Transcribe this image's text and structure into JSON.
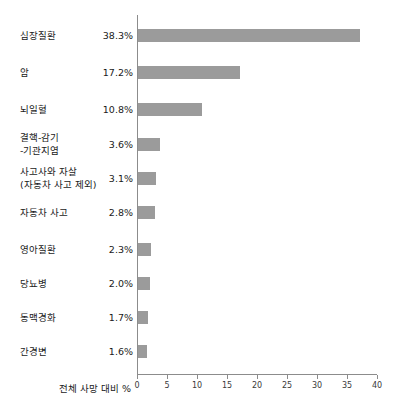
{
  "chart_data": {
    "type": "bar",
    "orientation": "horizontal",
    "title": "",
    "subtitle": "",
    "xlabel": "전체 사망 대비 %",
    "ylabel": "",
    "xlim": [
      0,
      40
    ],
    "xticks": [
      0,
      5,
      10,
      15,
      20,
      25,
      30,
      35,
      40
    ],
    "xtick_labels": [
      "0",
      "5",
      "10",
      "15",
      "20",
      "25",
      "30",
      "35",
      "40"
    ],
    "grid": false,
    "legend": null,
    "bar_color": "#9b9b9b",
    "axis_color": "#8c8c8c",
    "categories": [
      "심장질환",
      "암",
      "뇌일혈",
      "결핵-감기\n-기관지염",
      "사고사와 자살\n(자동차 사고 제외)",
      "자동차 사고",
      "영아질환",
      "당뇨병",
      "동맥경화",
      "간경변"
    ],
    "values": [
      38.3,
      17.2,
      10.8,
      3.6,
      3.1,
      2.8,
      2.3,
      2.0,
      1.7,
      1.6
    ],
    "value_labels": [
      "38.3%",
      "17.2%",
      "10.8%",
      "3.6%",
      "3.1%",
      "2.8%",
      "2.3%",
      "2.0%",
      "1.7%",
      "1.6%"
    ],
    "bar_lengths_units": [
      37.0,
      17.0,
      10.6,
      3.6,
      3.0,
      2.8,
      2.2,
      2.0,
      1.6,
      1.5
    ]
  }
}
